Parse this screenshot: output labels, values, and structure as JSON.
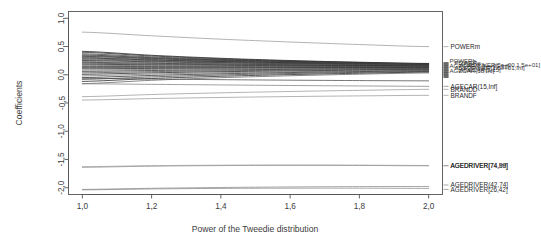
{
  "chart_data": {
    "type": "line",
    "title": "",
    "xlabel": "Power of the Tweedie distribution",
    "ylabel": "Coefficients",
    "xlim": [
      0.96,
      2.04
    ],
    "ylim": [
      -2.12,
      1.12
    ],
    "xticks": [
      1.0,
      1.2,
      1.4,
      1.6,
      1.8,
      2.0
    ],
    "xticklabels": [
      "1,0",
      "1,2",
      "1,4",
      "1,6",
      "1,8",
      "2,0"
    ],
    "yticks": [
      1.0,
      0.5,
      0.0,
      -0.5,
      -1.0,
      -1.5,
      -2.0
    ],
    "yticklabels": [
      "1,0",
      "0,5",
      "0,0",
      "-0,5",
      "-1,0",
      "-1,5",
      "-2,0"
    ],
    "grid": false,
    "legend": "right-margin-inline-labels",
    "decimal_separator": ",",
    "x": [
      1.0,
      1.2,
      1.4,
      1.6,
      1.8,
      2.0
    ],
    "series": [
      {
        "name": "POWERm",
        "label": "POWERm",
        "values": [
          0.755,
          0.69,
          0.63,
          0.58,
          0.535,
          0.498
        ],
        "color": "#9a9a9a",
        "label_y": 0.498
      },
      {
        "name": "s01",
        "label": "",
        "values": [
          0.415,
          0.345,
          0.292,
          0.252,
          0.222,
          0.2
        ],
        "color": "#1c1c1c",
        "label_y": 0.2
      },
      {
        "name": "s02",
        "label": "",
        "values": [
          0.398,
          0.333,
          0.283,
          0.246,
          0.218,
          0.197
        ],
        "color": "#2a2a2a",
        "label_y": 0.197
      },
      {
        "name": "s03",
        "label": "",
        "values": [
          0.372,
          0.316,
          0.272,
          0.238,
          0.212,
          0.193
        ],
        "color": "#3d3d3d",
        "label_y": 0.193
      },
      {
        "name": "s04",
        "label": "",
        "values": [
          0.352,
          0.301,
          0.262,
          0.231,
          0.208,
          0.19
        ],
        "color": "#1c1c1c",
        "label_y": 0.19
      },
      {
        "name": "s05",
        "label": "",
        "values": [
          0.338,
          0.292,
          0.255,
          0.226,
          0.204,
          0.187
        ],
        "color": "#505050",
        "label_y": 0.187
      },
      {
        "name": "s06",
        "label": "",
        "values": [
          0.326,
          0.283,
          0.249,
          0.222,
          0.201,
          0.185
        ],
        "color": "#2a2a2a",
        "label_y": 0.185
      },
      {
        "name": "s07",
        "label": "",
        "values": [
          0.311,
          0.272,
          0.241,
          0.216,
          0.197,
          0.182
        ],
        "color": "#6a6a6a",
        "label_y": 0.182
      },
      {
        "name": "s08",
        "label": "",
        "values": [
          0.298,
          0.262,
          0.234,
          0.211,
          0.193,
          0.179
        ],
        "color": "#1c1c1c",
        "label_y": 0.179
      },
      {
        "name": "s09",
        "label": "",
        "values": [
          0.283,
          0.251,
          0.226,
          0.205,
          0.189,
          0.176
        ],
        "color": "#3d3d3d",
        "label_y": 0.176
      },
      {
        "name": "s10",
        "label": "",
        "values": [
          0.268,
          0.24,
          0.217,
          0.199,
          0.184,
          0.172
        ],
        "color": "#555555",
        "label_y": 0.172
      },
      {
        "name": "s11",
        "label": "",
        "values": [
          0.252,
          0.228,
          0.208,
          0.192,
          0.179,
          0.168
        ],
        "color": "#1c1c1c",
        "label_y": 0.168
      },
      {
        "name": "s12",
        "label": "",
        "values": [
          0.236,
          0.216,
          0.199,
          0.185,
          0.173,
          0.164
        ],
        "color": "#777777",
        "label_y": 0.164
      },
      {
        "name": "s13",
        "label": "",
        "values": [
          0.22,
          0.203,
          0.189,
          0.177,
          0.167,
          0.159
        ],
        "color": "#2a2a2a",
        "label_y": 0.159
      },
      {
        "name": "s14",
        "label": "",
        "values": [
          0.204,
          0.19,
          0.179,
          0.169,
          0.161,
          0.154
        ],
        "color": "#444444",
        "label_y": 0.154
      },
      {
        "name": "s15",
        "label": "",
        "values": [
          0.186,
          0.176,
          0.167,
          0.16,
          0.154,
          0.148
        ],
        "color": "#1c1c1c",
        "label_y": 0.148
      },
      {
        "name": "s16",
        "label": "",
        "values": [
          0.168,
          0.161,
          0.155,
          0.15,
          0.146,
          0.142
        ],
        "color": "#5e5e5e",
        "label_y": 0.142
      },
      {
        "name": "s17",
        "label": "",
        "values": [
          0.148,
          0.145,
          0.142,
          0.139,
          0.137,
          0.135
        ],
        "color": "#2a2a2a",
        "label_y": 0.135
      },
      {
        "name": "s18",
        "label": "",
        "values": [
          0.128,
          0.129,
          0.129,
          0.129,
          0.129,
          0.128
        ],
        "color": "#3d3d3d",
        "label_y": 0.128
      },
      {
        "name": "s19",
        "label": "",
        "values": [
          0.106,
          0.112,
          0.115,
          0.118,
          0.12,
          0.121
        ],
        "color": "#1c1c1c",
        "label_y": 0.121
      },
      {
        "name": "s20",
        "label": "",
        "values": [
          0.084,
          0.094,
          0.101,
          0.107,
          0.111,
          0.114
        ],
        "color": "#6a6a6a",
        "label_y": 0.114
      },
      {
        "name": "s21",
        "label": "",
        "values": [
          0.06,
          0.075,
          0.086,
          0.095,
          0.101,
          0.106
        ],
        "color": "#2a2a2a",
        "label_y": 0.106
      },
      {
        "name": "s22",
        "label": "",
        "values": [
          0.034,
          0.055,
          0.07,
          0.082,
          0.091,
          0.098
        ],
        "color": "#494949",
        "label_y": 0.098
      },
      {
        "name": "s23",
        "label": "",
        "values": [
          0.008,
          0.034,
          0.054,
          0.068,
          0.08,
          0.089
        ],
        "color": "#1c1c1c",
        "label_y": 0.089
      },
      {
        "name": "s24",
        "label": "",
        "values": [
          -0.02,
          0.012,
          0.036,
          0.054,
          0.068,
          0.08
        ],
        "color": "#707070",
        "label_y": 0.08
      },
      {
        "name": "s25",
        "label": "",
        "values": [
          -0.05,
          -0.012,
          0.017,
          0.039,
          0.056,
          0.07
        ],
        "color": "#2a2a2a",
        "label_y": 0.07
      },
      {
        "name": "s26",
        "label": "",
        "values": [
          -0.082,
          -0.038,
          -0.004,
          0.022,
          0.043,
          0.059
        ],
        "color": "#3d3d3d",
        "label_y": 0.059
      },
      {
        "name": "s27",
        "label": "",
        "values": [
          -0.118,
          -0.066,
          -0.027,
          0.003,
          0.027,
          0.047
        ],
        "color": "#1c1c1c",
        "label_y": 0.047
      },
      {
        "name": "s28",
        "label": "",
        "values": [
          -0.158,
          -0.098,
          -0.052,
          -0.018,
          0.01,
          0.033
        ],
        "color": "#5e5e5e",
        "label_y": 0.033
      },
      {
        "name": "s29",
        "label": "",
        "values": [
          -0.062,
          -0.076,
          -0.087,
          -0.096,
          -0.103,
          -0.108
        ],
        "color": "#4a4a4a",
        "label_y": -0.108
      },
      {
        "name": "AGECAR",
        "label": "AGECAR(15,Inf]",
        "values": [
          -0.16,
          -0.17,
          -0.18,
          -0.19,
          -0.198,
          -0.205
        ],
        "color": "#808080",
        "label_y": -0.205
      },
      {
        "name": "BRANDD",
        "label": "BRANDD",
        "values": [
          -0.388,
          -0.35,
          -0.32,
          -0.296,
          -0.276,
          -0.258
        ],
        "color": "#9a9a9a",
        "label_y": -0.258
      },
      {
        "name": "BRANDF",
        "label": "BRANDF",
        "values": [
          -0.448,
          -0.422,
          -0.402,
          -0.386,
          -0.374,
          -0.364
        ],
        "color": "#9a9a9a",
        "label_y": -0.364
      },
      {
        "name": "AGEDRIVER_74_Inf_a",
        "label": "AGEDRIVER[74,Inf]",
        "values": [
          -1.638,
          -1.618,
          -1.608,
          -1.604,
          -1.606,
          -1.612
        ],
        "color": "#8a8a8a",
        "label_y": -1.612
      },
      {
        "name": "AGEDRIVER_74_Inf_b",
        "label": "AGEDRIVER(74,99]",
        "values": [
          -1.628,
          -1.61,
          -1.601,
          -1.598,
          -1.6,
          -1.606
        ],
        "color": "#9e9e9e",
        "label_y": -1.606
      },
      {
        "name": "AGEDRIVER_42_74",
        "label": "AGEDRIVER(42,74]",
        "values": [
          -2.03,
          -2.01,
          -1.996,
          -1.986,
          -1.98,
          -1.978
        ],
        "color": "#8a8a8a",
        "label_y": -1.952
      },
      {
        "name": "AGEDRIVER_26_42",
        "label": "AGEDRIVER[26,42]",
        "values": [
          -2.038,
          -2.022,
          -2.012,
          -2.008,
          -2.008,
          -2.012
        ],
        "color": "#8a8a8a",
        "label_y": -2.03
      }
    ],
    "dense_label_cluster": {
      "note": "Overlapping illegible coefficient labels stacked in the right margin",
      "lines": [
        "POWERb",
        "POWERc",
        "AGEDRIVER(5e+00,1.5e+01]",
        "AGECAR(1.5e+01,Inf]",
        "AGEDRIVER(1.5e+01,Inf]",
        "AGECAR(5,15]",
        "AGECAR(15,Inf]"
      ]
    }
  },
  "axis": {
    "y_title": "Coefficients",
    "x_title": "Power of the Tweedie distribution"
  }
}
